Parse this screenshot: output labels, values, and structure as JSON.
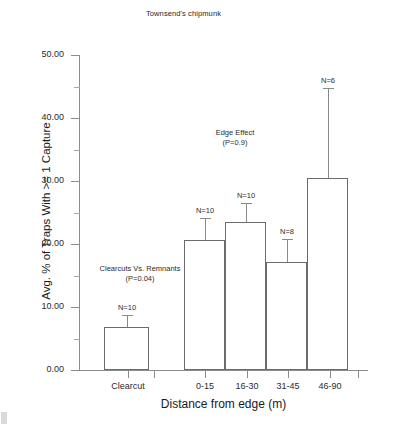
{
  "chart_data": {
    "type": "bar",
    "title": "Townsend's chipmunk",
    "xlabel": "Distance from edge (m)",
    "ylabel": "Avg. % of Traps With >= 1 Capture",
    "categories": [
      "Clearcut",
      "0-15",
      "16-30",
      "31-45",
      "46-90"
    ],
    "values": [
      6.9,
      20.7,
      23.5,
      17.2,
      30.5
    ],
    "error_upper": [
      8.7,
      24.2,
      26.5,
      20.8,
      44.8
    ],
    "sample_sizes": [
      "N=10",
      "N=10",
      "N=10",
      "N=8",
      "N=6"
    ],
    "ylim": [
      0.0,
      50.0
    ],
    "ytick_labels": [
      "0.00",
      "10.00",
      "20.00",
      "30.00",
      "40.00",
      "50.00"
    ],
    "ytick_values": [
      0,
      10,
      20,
      30,
      40,
      50
    ],
    "yminor_values": [
      5,
      15,
      25,
      35,
      45
    ],
    "grid": false,
    "legend": "none",
    "series": [
      {
        "name": "Avg. % of Traps With >= 1 Capture",
        "values": [
          6.9,
          20.7,
          23.5,
          17.2,
          30.5
        ]
      }
    ],
    "annotations": [
      {
        "id": "clearcuts-vs-remnants",
        "line1": "Clearcuts Vs. Remnants",
        "line2": "(P=0.04)"
      },
      {
        "id": "edge-effect",
        "line1": "Edge Effect",
        "line2": "(P=0.9)"
      }
    ]
  },
  "colors": {
    "axis": "#8c8c8c",
    "bar_stroke": "#6b6b6b",
    "error_bar": "#8a8a8a",
    "text": "#1a1a1a",
    "background": "#ffffff"
  }
}
